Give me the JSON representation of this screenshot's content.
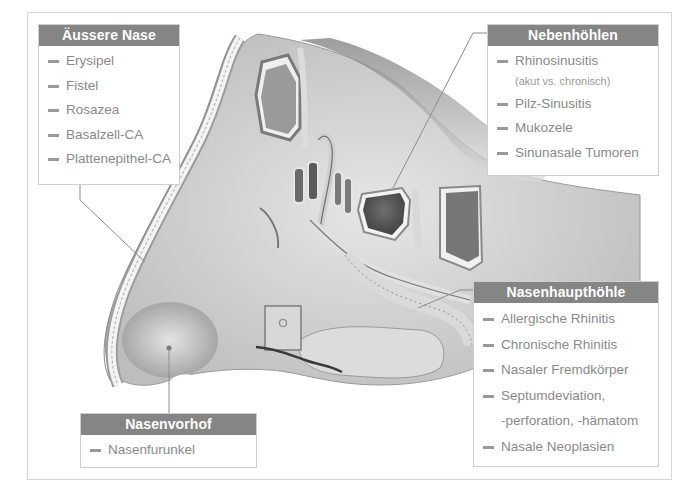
{
  "diagram": {
    "colors": {
      "header_bg": "#858585",
      "header_text": "#ffffff",
      "item_text": "#8a8a8a",
      "leader_line": "#8c8c8c",
      "border": "#cfcfcf"
    },
    "boxes": {
      "aeussere_nase": {
        "title": "Äussere Nase",
        "items": [
          "Erysipel",
          "Fistel",
          "Rosazea",
          "Basalzell-CA",
          "Plattenepithel-CA"
        ]
      },
      "nebenhoehlen": {
        "title": "Nebenhöhlen",
        "items": [
          "Rhinosinusitis",
          "(akut vs. chronisch)",
          "Pilz-Sinusitis",
          "Mukozele",
          "Sinunasale Tumoren"
        ]
      },
      "nasenhaupthoehle": {
        "title": "Nasenhaupthöhle",
        "items": [
          "Allergische Rhinitis",
          "Chronische Rhinitis",
          "Nasaler Fremdkörper",
          "Septumdeviation,",
          "-perforation, -hämatom",
          "Nasale Neoplasien"
        ]
      },
      "nasenvorhof": {
        "title": "Nasenvorhof",
        "items": [
          "Nasenfurunkel"
        ]
      }
    }
  }
}
